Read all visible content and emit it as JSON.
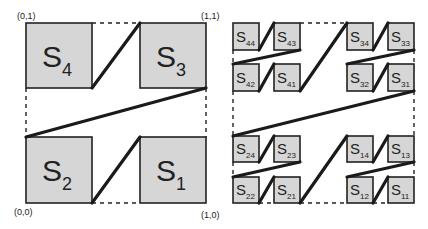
{
  "left_diagram": {
    "corners": {
      "top_left": "(0,1)",
      "top_right": "(1,1)",
      "bottom_left": "(0,0)",
      "bottom_right": "(1,0)"
    },
    "squares": [
      {
        "label": "S",
        "sub": "4"
      },
      {
        "label": "S",
        "sub": "3"
      },
      {
        "label": "S",
        "sub": "2"
      },
      {
        "label": "S",
        "sub": "1"
      }
    ]
  },
  "right_diagram": {
    "squares": [
      {
        "label": "S",
        "sub": "44"
      },
      {
        "label": "S",
        "sub": "43"
      },
      {
        "label": "S",
        "sub": "34"
      },
      {
        "label": "S",
        "sub": "33"
      },
      {
        "label": "S",
        "sub": "42"
      },
      {
        "label": "S",
        "sub": "41"
      },
      {
        "label": "S",
        "sub": "32"
      },
      {
        "label": "S",
        "sub": "31"
      },
      {
        "label": "S",
        "sub": "24"
      },
      {
        "label": "S",
        "sub": "23"
      },
      {
        "label": "S",
        "sub": "14"
      },
      {
        "label": "S",
        "sub": "13"
      },
      {
        "label": "S",
        "sub": "22"
      },
      {
        "label": "S",
        "sub": "21"
      },
      {
        "label": "S",
        "sub": "12"
      },
      {
        "label": "S",
        "sub": "11"
      }
    ]
  }
}
